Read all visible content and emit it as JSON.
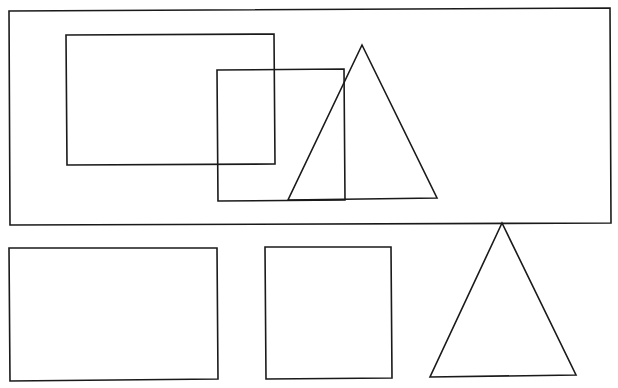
{
  "diagram": {
    "title": "",
    "stroke_color": "#1a1a1a",
    "background_color": "#ffffff",
    "groups": [
      {
        "name": "composite-figure",
        "description": "Composite figure: two overlapping rectangles and an overlapping triangle inside a framing rectangle",
        "shapes": [
          {
            "id": "frame",
            "kind": "rectangle",
            "role": "container"
          },
          {
            "id": "rect-a",
            "kind": "rectangle",
            "role": "overlapping-rectangle",
            "overlaps": [
              "rect-b"
            ]
          },
          {
            "id": "rect-b",
            "kind": "rectangle",
            "role": "overlapping-square",
            "overlaps": [
              "rect-a",
              "triangle-top"
            ]
          },
          {
            "id": "triangle-top",
            "kind": "triangle",
            "role": "overlapping-triangle",
            "overlaps": [
              "rect-b"
            ]
          }
        ]
      },
      {
        "name": "separate-shapes",
        "description": "The same three shapes drawn separately below",
        "shapes": [
          {
            "id": "rect-bottom",
            "kind": "rectangle",
            "role": "rectangle"
          },
          {
            "id": "square-bottom",
            "kind": "rectangle",
            "role": "square"
          },
          {
            "id": "triangle-bottom",
            "kind": "triangle",
            "role": "triangle"
          }
        ]
      }
    ]
  }
}
